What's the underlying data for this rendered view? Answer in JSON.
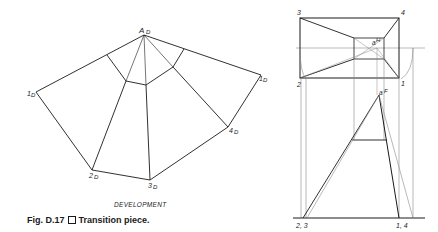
{
  "figure": {
    "caption_prefix": "Fig. D.17",
    "caption_text": "Transition piece.",
    "development_label": "DEVELOPMENT"
  },
  "development": {
    "apex": {
      "label": "A",
      "sub": "D"
    },
    "points": [
      {
        "label": "1",
        "sub": "D",
        "position": "left"
      },
      {
        "label": "2",
        "sub": "D"
      },
      {
        "label": "3",
        "sub": "D"
      },
      {
        "label": "4",
        "sub": "D"
      },
      {
        "label": "1",
        "sub": "D",
        "position": "right"
      }
    ]
  },
  "top_view": {
    "corners": [
      "3",
      "4",
      "2",
      "1"
    ],
    "center_label": "a",
    "center_sub": "H"
  },
  "front_view": {
    "apex_label": "a",
    "apex_sub": "F",
    "base_left_label": "2, 3",
    "base_right_label": "1, 4"
  },
  "colors": {
    "line": "#1a1a1a",
    "construction_line": "#8a8a8a",
    "background": "#ffffff"
  }
}
